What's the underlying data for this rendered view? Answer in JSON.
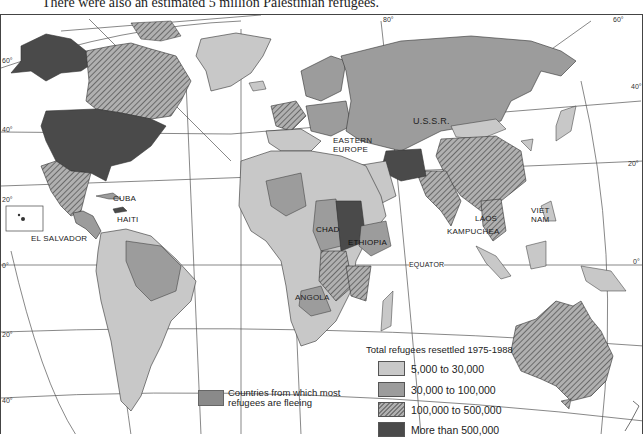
{
  "caption": "There were also an estimated 5 million Palestinian refugees.",
  "map": {
    "title": "Total refugees resettled 1975-1988",
    "country_labels": [
      {
        "id": "ussr",
        "text": "U.S.S.R."
      },
      {
        "id": "eastern_europe_1",
        "text": "EASTERN"
      },
      {
        "id": "eastern_europe_2",
        "text": "EUROPE"
      },
      {
        "id": "cuba",
        "text": "CUBA"
      },
      {
        "id": "haiti",
        "text": "HAITI"
      },
      {
        "id": "el_salvador",
        "text": "EL SALVADOR"
      },
      {
        "id": "chad",
        "text": "CHAD"
      },
      {
        "id": "ethiopia",
        "text": "ETHIOPIA"
      },
      {
        "id": "angola",
        "text": "ANGOLA"
      },
      {
        "id": "laos",
        "text": "LAOS"
      },
      {
        "id": "kampuchea",
        "text": "KAMPUCHEA"
      },
      {
        "id": "viet_nam_1",
        "text": "VIET"
      },
      {
        "id": "viet_nam_2",
        "text": "NAM"
      },
      {
        "id": "equator",
        "text": "EQUATOR"
      }
    ],
    "latitude_labels": {
      "left": [
        "60°",
        "40°",
        "20°",
        "0°",
        "20°",
        "40°"
      ],
      "right": [
        "80°",
        "60°",
        "40°",
        "20°",
        "0°"
      ]
    }
  },
  "legend": {
    "title": "Total refugees resettled  1975-1988",
    "items": [
      {
        "label": "5,000 to 30,000",
        "color": "#c8c8c8",
        "pattern": "solid"
      },
      {
        "label": "30,000 to 100,000",
        "color": "#9c9c9c",
        "pattern": "solid"
      },
      {
        "label": "100,000 to 500,000",
        "color": "#8c8c8c",
        "pattern": "hatched"
      },
      {
        "label": "More than 500,000",
        "color": "#4a4a4a",
        "pattern": "solid"
      }
    ],
    "fleeing": {
      "label": "Countries from which most refugees are fleeing",
      "color": "#8a8a8a"
    }
  },
  "colors": {
    "light": "#c8c8c8",
    "medium": "#9c9c9c",
    "hatched": "#8c8c8c",
    "dark": "#4a4a4a",
    "ocean": "#ffffff",
    "grid": "#555555"
  }
}
